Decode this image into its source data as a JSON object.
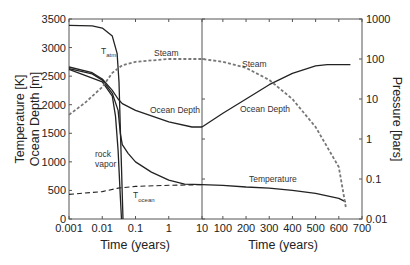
{
  "chart_data": {
    "type": "line",
    "title": "",
    "panels": [
      {
        "name": "early",
        "xscale": "log",
        "xlim": [
          0.001,
          10
        ],
        "xticks": [
          "0.001",
          "0.01",
          "0.1",
          "1",
          "10"
        ],
        "xlabel": "Time (years)"
      },
      {
        "name": "late",
        "xscale": "linear",
        "xlim": [
          10,
          700
        ],
        "xticks": [
          "10",
          "100",
          "200",
          "300",
          "400",
          "500",
          "600",
          "700"
        ],
        "xlabel": "Time (years)"
      }
    ],
    "y_left": {
      "label_line1": "Temperature [K]",
      "label_line2": "Ocean Depth [m]",
      "ylim": [
        0,
        3500
      ],
      "ticks": [
        "0",
        "500",
        "1000",
        "1500",
        "2000",
        "2500",
        "3000",
        "3500"
      ]
    },
    "y_right": {
      "label": "Pressure [bars]",
      "scale": "log",
      "ylim": [
        0.01,
        1000
      ],
      "ticks": [
        "0.01",
        "0.1",
        "1",
        "10",
        "100",
        "1000"
      ]
    },
    "series": [
      {
        "name": "T_atm",
        "axis": "left",
        "style": "solid",
        "points": [
          [
            0.001,
            3390
          ],
          [
            0.005,
            3380
          ],
          [
            0.01,
            3340
          ],
          [
            0.02,
            3200
          ],
          [
            0.028,
            2900
          ],
          [
            0.032,
            2400
          ],
          [
            0.035,
            1600
          ],
          [
            0.038,
            900
          ],
          [
            0.04,
            400
          ],
          [
            0.042,
            0
          ]
        ]
      },
      {
        "name": "Rock vapor boundary (to ocean depth)",
        "axis": "left",
        "style": "solid",
        "points": [
          [
            0.001,
            2660
          ],
          [
            0.005,
            2560
          ],
          [
            0.01,
            2450
          ],
          [
            0.02,
            2250
          ],
          [
            0.03,
            2100
          ],
          [
            0.04,
            2020
          ],
          [
            0.1,
            1900
          ],
          [
            1,
            1700
          ],
          [
            5,
            1610
          ],
          [
            10,
            1610
          ]
        ]
      },
      {
        "name": "Rock vapor boundary (to temperature)",
        "axis": "left",
        "style": "solid",
        "points": [
          [
            0.001,
            2630
          ],
          [
            0.005,
            2540
          ],
          [
            0.01,
            2430
          ],
          [
            0.02,
            2200
          ],
          [
            0.03,
            1900
          ],
          [
            0.035,
            1500
          ],
          [
            0.04,
            1300
          ],
          [
            0.06,
            1150
          ],
          [
            0.1,
            1000
          ],
          [
            0.3,
            820
          ],
          [
            1,
            680
          ],
          [
            3,
            610
          ],
          [
            10,
            600
          ]
        ]
      },
      {
        "name": "Rock vapor (left edge)",
        "axis": "left",
        "style": "solid",
        "points": [
          [
            0.001,
            2620
          ],
          [
            0.01,
            2400
          ],
          [
            0.02,
            2150
          ],
          [
            0.025,
            1800
          ],
          [
            0.03,
            1200
          ],
          [
            0.035,
            400
          ],
          [
            0.038,
            0
          ]
        ]
      },
      {
        "name": "Ocean Depth",
        "axis": "left",
        "style": "solid",
        "points": [
          [
            10,
            1610
          ],
          [
            100,
            1850
          ],
          [
            200,
            2100
          ],
          [
            300,
            2350
          ],
          [
            400,
            2550
          ],
          [
            500,
            2680
          ],
          [
            550,
            2700
          ],
          [
            650,
            2700
          ]
        ]
      },
      {
        "name": "Temperature",
        "axis": "left",
        "style": "solid",
        "points": [
          [
            10,
            600
          ],
          [
            100,
            590
          ],
          [
            200,
            560
          ],
          [
            300,
            540
          ],
          [
            400,
            500
          ],
          [
            500,
            450
          ],
          [
            600,
            360
          ],
          [
            630,
            300
          ]
        ]
      },
      {
        "name": "T_ocean",
        "axis": "left",
        "style": "dashed",
        "points": [
          [
            0.001,
            430
          ],
          [
            0.01,
            480
          ],
          [
            0.03,
            540
          ],
          [
            0.1,
            570
          ],
          [
            1,
            590
          ],
          [
            10,
            600
          ]
        ]
      },
      {
        "name": "Steam",
        "axis": "right",
        "style": "dashed",
        "points": [
          [
            0.001,
            4
          ],
          [
            0.003,
            8
          ],
          [
            0.01,
            20
          ],
          [
            0.02,
            45
          ],
          [
            0.04,
            70
          ],
          [
            0.1,
            85
          ],
          [
            1,
            100
          ],
          [
            10,
            100
          ],
          [
            100,
            85
          ],
          [
            200,
            60
          ],
          [
            300,
            30
          ],
          [
            400,
            10
          ],
          [
            500,
            2
          ],
          [
            600,
            0.2
          ],
          [
            630,
            0.02
          ]
        ]
      }
    ],
    "annotations": [
      {
        "text": "T",
        "sub": "atm"
      },
      {
        "text": "Steam"
      },
      {
        "text": "Steam"
      },
      {
        "text": "Ocean Depth"
      },
      {
        "text": "Ocean Depth"
      },
      {
        "text": "rock"
      },
      {
        "text": "vapor"
      },
      {
        "text": "T",
        "sub": "ocean"
      },
      {
        "text": "Temperature"
      }
    ],
    "grid": false,
    "legend": "none (inline annotations)"
  },
  "labels": {
    "xlabel_left": "Time (years)",
    "xlabel_right": "Time (years)",
    "ylabel_left_1": "Temperature [K]",
    "ylabel_left_2": "Ocean Depth [m]",
    "ylabel_right": "Pressure [bars]",
    "ann_tatm": "T",
    "ann_tatm_sub": "atm",
    "ann_steam_left": "Steam",
    "ann_steam_right": "Steam",
    "ann_ocean_left": "Ocean Depth",
    "ann_ocean_right": "Ocean Depth",
    "ann_rock": "rock",
    "ann_vapor": "vapor",
    "ann_tocean": "T",
    "ann_tocean_sub": "ocean",
    "ann_temperature": "Temperature"
  },
  "colors": {
    "line": "#222222",
    "dash": "#777777",
    "axis": "#555555"
  }
}
